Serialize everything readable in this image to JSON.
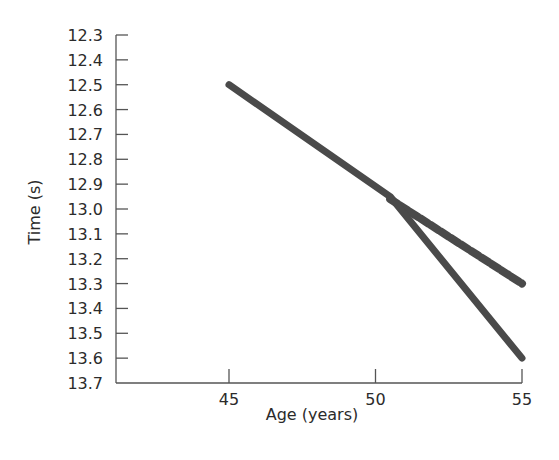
{
  "chart_data": {
    "type": "line",
    "title": "",
    "xlabel": "Age (years)",
    "ylabel": "Time (s)",
    "x_ticks": [
      45,
      50,
      55
    ],
    "y_ticks": [
      "12.3",
      "12.4",
      "12.5",
      "12.6",
      "12.7",
      "12.8",
      "12.9",
      "13.0",
      "13.1",
      "13.2",
      "13.3",
      "13.4",
      "13.5",
      "13.6",
      "13.7"
    ],
    "xlim": [
      40,
      55
    ],
    "ylim": [
      13.7,
      12.3
    ],
    "y_inverted": true,
    "grid": false,
    "legend": null,
    "series": [
      {
        "name": "solid",
        "style": "solid",
        "color": "#4a4a4a",
        "x": [
          45,
          50.5,
          55
        ],
        "y": [
          12.5,
          12.95,
          13.6
        ]
      },
      {
        "name": "dashed",
        "style": "dashed",
        "color": "#4a4a4a",
        "x": [
          50.5,
          55
        ],
        "y": [
          12.96,
          13.3
        ]
      }
    ]
  },
  "labels": {
    "xlabel": "Age (years)",
    "ylabel": "Time (s)"
  }
}
